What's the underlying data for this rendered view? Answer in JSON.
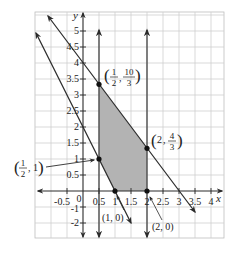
{
  "figure": {
    "type": "linear-programming-feasible-region",
    "axis_labels": {
      "x": "x",
      "y": "y"
    },
    "x_ticks": [
      "-0.5",
      "0",
      "0.5",
      "1",
      "1.5",
      "2",
      "2.5",
      "3",
      "3.5",
      "4"
    ],
    "y_ticks": [
      "-2",
      "-1",
      "0.5",
      "1",
      "1.5",
      "2",
      "2.5",
      "3",
      "3.5",
      "4",
      "4.5",
      "5"
    ],
    "lines": [
      {
        "name": "2x + y = 2",
        "slope": -2,
        "intercept": 2
      },
      {
        "name": "4x + 3y = 12",
        "slope": -1.3333,
        "intercept": 4
      },
      {
        "name": "x = 0.5",
        "vertical": 0.5
      },
      {
        "name": "x = 2",
        "vertical": 2
      }
    ],
    "vertices": [
      {
        "x": 0.5,
        "y": 3.3333,
        "label_a": "1",
        "label_a_den": "2",
        "label_b": "10",
        "label_b_den": "3"
      },
      {
        "x": 2,
        "y": 1.3333,
        "label_whole": "2",
        "label_b": "4",
        "label_b_den": "3"
      },
      {
        "x": 0.5,
        "y": 1,
        "label_a": "1",
        "label_a_den": "2",
        "label_whole_b": "1"
      },
      {
        "x": 1,
        "y": 0,
        "label": "(1, 0)"
      },
      {
        "x": 2,
        "y": 0,
        "label": "(2, 0)"
      }
    ],
    "shaded_region_color": "#b3b3b3",
    "grid_color": "#cccccc",
    "line_color": "#2b2b2b"
  }
}
